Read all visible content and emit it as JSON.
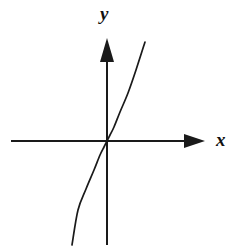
{
  "figure": {
    "background_color": "#ffffff",
    "stroke_color": "#1a1a1a",
    "width": 248,
    "height": 251
  },
  "axes": {
    "x_label": "x",
    "y_label": "y",
    "origin": {
      "x": 107,
      "y": 141
    },
    "x_axis": {
      "start_x": 11,
      "end_x": 205,
      "y": 141,
      "arrow": "right"
    },
    "y_axis": {
      "x": 107,
      "start_y": 245,
      "end_y": 38,
      "arrow": "up"
    },
    "arrow_head_name": "axis-arrowhead"
  },
  "chart_data": {
    "type": "line",
    "title": "",
    "xlabel": "x",
    "ylabel": "y",
    "grid": false,
    "legend": null,
    "axis_style": "arrows-both-directions",
    "origin_pixel": [
      107,
      141
    ],
    "xlim": [
      -4,
      4
    ],
    "ylim": [
      -4,
      4
    ],
    "series": [
      {
        "name": "cubic",
        "description": "Increasing odd cubic-like curve passing through the origin",
        "x": [
          -1.45,
          -1.2,
          -0.95,
          -0.7,
          -0.45,
          -0.2,
          0.0,
          0.2,
          0.45,
          0.7,
          0.95,
          1.2,
          1.45
        ],
        "y": [
          -2.17,
          -1.9,
          -1.6,
          -1.25,
          -0.82,
          -0.37,
          0.0,
          0.37,
          0.82,
          1.25,
          1.6,
          1.9,
          2.17
        ],
        "pixel_points": [
          [
            72,
            245
          ],
          [
            78,
            210
          ],
          [
            86,
            189
          ],
          [
            94,
            170
          ],
          [
            100,
            155
          ],
          [
            104,
            147
          ],
          [
            107,
            141
          ],
          [
            110,
            135
          ],
          [
            114,
            127
          ],
          [
            120,
            112
          ],
          [
            128,
            93
          ],
          [
            136,
            70
          ],
          [
            145,
            42
          ]
        ]
      }
    ]
  }
}
